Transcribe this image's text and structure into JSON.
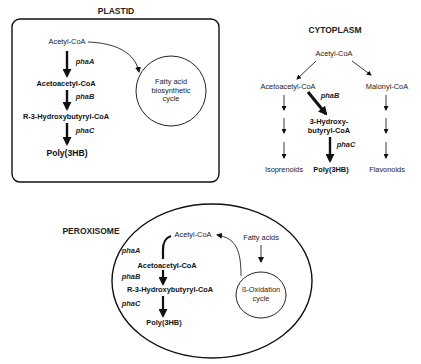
{
  "plastid": {
    "title": "PLASTID",
    "acetyl_coa": "Acetyl-CoA",
    "enzyme_a": "phaA",
    "acetoacetyl_coa": "Acetoacetyl-CoA",
    "enzyme_b": "phaB",
    "hydroxybutyryl_coa": "R-3-Hydroxybutyryl-CoA",
    "enzyme_c": "phaC",
    "product": "Poly(3HB)",
    "cycle_line1": "Fatty acid",
    "cycle_line2": "biosynthetic",
    "cycle_line3": "cycle"
  },
  "cytoplasm": {
    "title": "CYTOPLASM",
    "acetyl_coa": "Acetyl-CoA",
    "acetoacetyl_coa": "Acetoacetyl-CoA",
    "malonyl_coa": "Malonyl-CoA",
    "enzyme_b": "phaB",
    "hydroxy_line1": "3-Hydroxy-",
    "hydroxy_line2": "butyryl-CoA",
    "enzyme_c": "phaC",
    "isoprenoids": "Isoprenoids",
    "product": "Poly(3HB)",
    "flavonoids": "Flavonoids"
  },
  "peroxisome": {
    "title": "PEROXISOME",
    "acetyl_coa": "Acetyl-CoA",
    "fatty_acids": "Fatty acids",
    "enzyme_a": "phaA",
    "acetoacetyl_coa": "Acetoacetyl-CoA",
    "enzyme_b": "phaB",
    "hydroxybutyryl_coa": "R-3-Hydroxybutyryl-CoA",
    "enzyme_c": "phaC",
    "product": "Poly(3HB)",
    "cycle_line1": "ß-Oxidation",
    "cycle_line2": "cycle"
  }
}
